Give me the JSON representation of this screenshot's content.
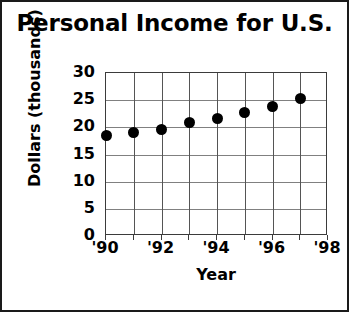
{
  "chart_data": {
    "type": "scatter",
    "title": "Personal Income for U.S.",
    "xlabel": "Year",
    "ylabel": "Dollars (thousands)",
    "x": [
      1990,
      1991,
      1992,
      1993,
      1994,
      1995,
      1996,
      1997
    ],
    "values": [
      18.5,
      19.0,
      19.6,
      20.8,
      21.6,
      22.8,
      23.9,
      25.3
    ],
    "categories": [
      "'90",
      "'91",
      "'92",
      "'93",
      "'94",
      "'95",
      "'96",
      "'97"
    ],
    "xlim": [
      1990,
      1998
    ],
    "ylim": [
      0,
      30
    ],
    "ytick_labels": [
      "0",
      "5",
      "10",
      "15",
      "20",
      "25",
      "30"
    ],
    "ytick_values": [
      0,
      5,
      10,
      15,
      20,
      25,
      30
    ],
    "xtick_labels": [
      "'90",
      "'92",
      "'94",
      "'96",
      "'98"
    ],
    "xtick_values": [
      1990,
      1992,
      1994,
      1996,
      1998
    ],
    "xgrid_values": [
      1990,
      1991,
      1992,
      1993,
      1994,
      1995,
      1996,
      1997,
      1998
    ],
    "grid": true,
    "legend": null,
    "marker_color": "#000000",
    "grid_color": "#808080",
    "axis_color": "#3b3b3b",
    "background_color": "#ffffff",
    "text_color": "#000000"
  }
}
